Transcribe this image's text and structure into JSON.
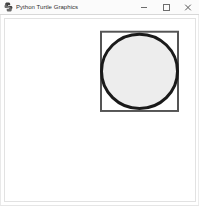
{
  "window": {
    "title": "Python Turtle Graphics",
    "icon": "python-turtle-icon",
    "background_color": "#ffffff",
    "titlebar_color": "#fbfbfb"
  },
  "titlebar": {
    "minimize_label": "—",
    "maximize_label": "□",
    "close_label": "✕",
    "minimize_name": "minimize-icon",
    "maximize_name": "maximize-icon",
    "close_name": "close-icon"
  },
  "canvas": {
    "background_color": "#ffffff",
    "border_color": "#e2e2e2",
    "shapes": [
      {
        "name": "square-outline",
        "type": "rect",
        "x": 96,
        "y": 13,
        "width": 77,
        "height": 81,
        "stroke_color": "#555555",
        "stroke_width": 2,
        "fill": "none"
      },
      {
        "name": "circle-filled",
        "type": "circle",
        "cx": 134.5,
        "cy": 53.5,
        "r": 38,
        "stroke_color": "#1a1a1a",
        "stroke_width": 3,
        "fill_color": "#ededed"
      }
    ]
  }
}
